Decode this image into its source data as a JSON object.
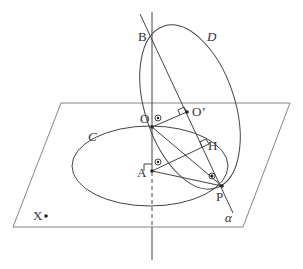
{
  "diagram": {
    "labels": {
      "B": "B",
      "D": "D",
      "O": "O",
      "O_prime": "O’",
      "H": "H",
      "C": "C",
      "A": "A",
      "P": "P",
      "X": "X",
      "alpha": "α"
    },
    "colors": {
      "line": "#444444",
      "text": "#333333",
      "background": "#ffffff"
    }
  }
}
